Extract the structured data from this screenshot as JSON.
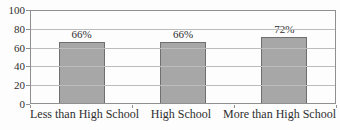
{
  "chart_data": {
    "type": "bar",
    "categories": [
      "Less than High School",
      "High School",
      "More than High School"
    ],
    "values": [
      66,
      66,
      72
    ],
    "value_labels": [
      "66%",
      "66%",
      "72%"
    ],
    "ylim": [
      0,
      100
    ],
    "yticks": [
      0,
      20,
      40,
      60,
      80,
      100
    ],
    "grid": true,
    "legend": false,
    "colors": {
      "bar_fill": "#a7a7a7",
      "bar_border": "#6f6f6f",
      "gridline": "#bcbcbc",
      "axis": "#8f8f8f",
      "text": "#2e2e2e",
      "background": "#fdfdfd"
    }
  }
}
